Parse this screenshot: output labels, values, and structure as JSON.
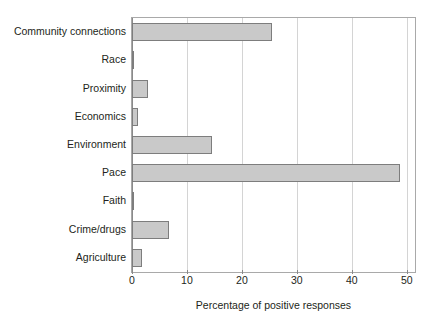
{
  "chart_data": {
    "type": "bar",
    "orientation": "horizontal",
    "title": "",
    "xlabel": "Percentage of positive responses",
    "ylabel": "",
    "xlim": [
      0,
      51.5
    ],
    "xticks": [
      0,
      10,
      20,
      30,
      40,
      50
    ],
    "xtick_labels": [
      "0",
      "10",
      "20",
      "30",
      "40",
      "50"
    ],
    "grid": "vertical",
    "legend": "none",
    "categories": [
      "Community connections",
      "Race",
      "Proximity",
      "Economics",
      "Environment",
      "Pace",
      "Faith",
      "Crime/drugs",
      "Agriculture"
    ],
    "values": [
      25.5,
      0.2,
      2.9,
      1.1,
      14.6,
      48.8,
      0.3,
      6.7,
      1.8
    ],
    "series": [
      {
        "name": "Percentage of positive responses",
        "values": [
          25.5,
          0.2,
          2.9,
          1.1,
          14.6,
          48.8,
          0.3,
          6.7,
          1.8
        ]
      }
    ],
    "bar_fill_color": "#c9c9c9",
    "bar_border_color": "#7d7d7d",
    "gridline_color": "#d4d4d4",
    "axis_color": "#a9a9a9",
    "background_color": "#ffffff",
    "text_color": "#231f20"
  }
}
